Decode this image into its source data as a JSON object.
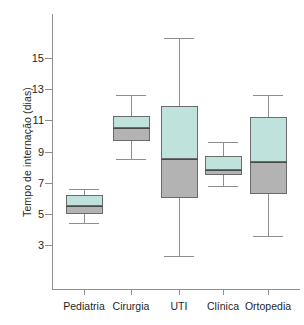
{
  "chart_data": {
    "type": "box",
    "title": "",
    "xlabel": "",
    "ylabel": "Tempo de internação (dias)",
    "categories": [
      "Pediatria",
      "Cirurgia",
      "UTI",
      "Clínica",
      "Ortopedia"
    ],
    "ylim": [
      1.5,
      17
    ],
    "yticks": [
      3,
      5,
      7,
      9,
      11,
      13,
      15
    ],
    "ytick_labels": [
      "3",
      "5",
      "7",
      "9",
      "11",
      "13",
      "15"
    ],
    "grid": false,
    "legend": "none",
    "colors": {
      "upper_box_fill": "#bfe3dc",
      "lower_box_fill": "#b3b3b3",
      "box_border": "#6b6b6b",
      "median_line": "#4a4a4a",
      "whisker": "#8e8e8e",
      "axis": "#8e8e8e",
      "text": "#1f1f1f",
      "background": "#ffffff"
    },
    "boxes": [
      {
        "category": "Pediatria",
        "whisker_low": 4.4,
        "q1": 5.0,
        "median": 5.5,
        "q3": 6.2,
        "whisker_high": 6.6
      },
      {
        "category": "Cirurgia",
        "whisker_low": 8.5,
        "q1": 9.7,
        "median": 10.5,
        "q3": 11.3,
        "whisker_high": 12.6
      },
      {
        "category": "UTI",
        "whisker_low": 2.3,
        "q1": 6.0,
        "median": 8.5,
        "q3": 11.9,
        "whisker_high": 16.3
      },
      {
        "category": "Clínica",
        "whisker_low": 6.8,
        "q1": 7.5,
        "median": 7.8,
        "q3": 8.7,
        "whisker_high": 9.6
      },
      {
        "category": "Ortopedia",
        "whisker_low": 3.6,
        "q1": 6.3,
        "median": 8.3,
        "q3": 11.2,
        "whisker_high": 12.6
      }
    ]
  }
}
